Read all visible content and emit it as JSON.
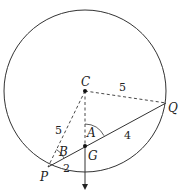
{
  "diagram": {
    "colors": {
      "stroke": "#333333",
      "background": "#ffffff"
    },
    "circle": {
      "cx": 85,
      "cy": 91,
      "r": 81
    },
    "points": {
      "C": {
        "label": "C",
        "x": 85,
        "y": 91
      },
      "G": {
        "label": "G",
        "x": 85,
        "y": 146
      },
      "P": {
        "label": "P",
        "x": 48,
        "y": 167
      },
      "Q": {
        "label": "Q",
        "x": 166,
        "y": 103
      }
    },
    "angles": {
      "A": {
        "label": "A"
      },
      "B": {
        "label": "B"
      }
    },
    "lengths": {
      "CQ": "5",
      "CP": "5",
      "GQ": "4",
      "PG": "2"
    }
  }
}
